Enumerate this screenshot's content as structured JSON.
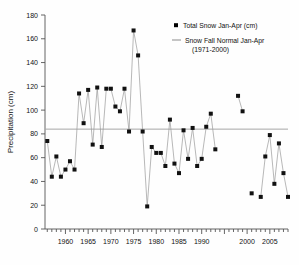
{
  "chart_data": {
    "type": "line",
    "title": "",
    "xlabel": "",
    "ylabel": "Precipitation (cm)",
    "xlim": [
      1955.5,
      2009
    ],
    "ylim": [
      0,
      180
    ],
    "ytick_labels": [
      "0",
      "20",
      "40",
      "60",
      "80",
      "100",
      "120",
      "140",
      "160",
      "180"
    ],
    "yticks": [
      0,
      20,
      40,
      60,
      80,
      100,
      120,
      140,
      160,
      180
    ],
    "xtick_labels": [
      "1960",
      "1965",
      "1970",
      "1975",
      "1980",
      "1985",
      "1990",
      "2000",
      "2005"
    ],
    "xticks": [
      1960,
      1965,
      1970,
      1975,
      1980,
      1985,
      1990,
      2000,
      2005
    ],
    "grid": false,
    "legend_position": "top-right",
    "legend": [
      {
        "name": "Total Snow Jan-Apr (cm)",
        "marker": "square",
        "color": "#000000"
      },
      {
        "name": "Snow Fall Normal Jan-Apr",
        "marker": "line",
        "color": "#999999"
      },
      {
        "name": "(1971-2000)",
        "marker": "none",
        "color": "#000000"
      }
    ],
    "reference_line": {
      "label": "Snow Fall Normal Jan-Apr (1971-2000)",
      "value": 84,
      "color": "#a6a6a6"
    },
    "series": [
      {
        "name": "Total Snow Jan-Apr (cm)",
        "color": "#000000",
        "x": [
          1956,
          1957,
          1958,
          1959,
          1960,
          1961,
          1962,
          1963,
          1964,
          1965,
          1966,
          1967,
          1968,
          1969,
          1970,
          1971,
          1972,
          1973,
          1974,
          1975,
          1976,
          1977,
          1978,
          1979,
          1980,
          1981,
          1982,
          1983,
          1984,
          1985,
          1986,
          1987,
          1988,
          1989,
          1990,
          1991,
          1992,
          1993,
          2000,
          2002,
          2003,
          2004,
          2005,
          2006,
          2007
        ],
        "values": [
          74,
          44,
          61,
          44,
          50,
          57,
          50,
          114,
          89,
          117,
          71,
          119,
          69,
          118,
          118,
          103,
          99,
          118,
          82,
          167,
          146,
          82,
          19,
          69,
          64,
          64,
          53,
          92,
          55,
          47,
          83,
          59,
          85,
          53,
          59,
          86,
          97,
          67,
          112,
          99,
          30,
          27,
          61,
          79,
          38
        ]
      }
    ],
    "data_points": [
      {
        "year": 1956,
        "value": 74
      },
      {
        "year": 1957,
        "value": 44
      },
      {
        "year": 1958,
        "value": 61
      },
      {
        "year": 1959,
        "value": 44
      },
      {
        "year": 1960,
        "value": 50
      },
      {
        "year": 1961,
        "value": 57
      },
      {
        "year": 1962,
        "value": 50
      },
      {
        "year": 1963,
        "value": 114
      },
      {
        "year": 1964,
        "value": 89
      },
      {
        "year": 1965,
        "value": 117
      },
      {
        "year": 1966,
        "value": 71
      },
      {
        "year": 1967,
        "value": 119
      },
      {
        "year": 1968,
        "value": 69
      },
      {
        "year": 1969,
        "value": 118
      },
      {
        "year": 1970,
        "value": 118
      },
      {
        "year": 1971,
        "value": 103
      },
      {
        "year": 1972,
        "value": 99
      },
      {
        "year": 1973,
        "value": 118
      },
      {
        "year": 1974,
        "value": 82
      },
      {
        "year": 1975,
        "value": 167
      },
      {
        "year": 1976,
        "value": 146
      },
      {
        "year": 1977,
        "value": 82
      },
      {
        "year": 1978,
        "value": 19
      },
      {
        "year": 1979,
        "value": 69
      },
      {
        "year": 1980,
        "value": 64
      },
      {
        "year": 1981,
        "value": 64
      },
      {
        "year": 1982,
        "value": 53
      },
      {
        "year": 1983,
        "value": 92
      },
      {
        "year": 1984,
        "value": 55
      },
      {
        "year": 1985,
        "value": 47
      },
      {
        "year": 1986,
        "value": 83
      },
      {
        "year": 1987,
        "value": 59
      },
      {
        "year": 1988,
        "value": 85
      },
      {
        "year": 1989,
        "value": 53
      },
      {
        "year": 1990,
        "value": 59
      },
      {
        "year": 1991,
        "value": 86
      },
      {
        "year": 1992,
        "value": 97
      },
      {
        "year": 1993,
        "value": 67
      },
      {
        "year": 1998,
        "value": 112
      },
      {
        "year": 1999,
        "value": 99
      },
      {
        "year": 2001,
        "value": 30
      },
      {
        "year": 2003,
        "value": 27
      },
      {
        "year": 2004,
        "value": 61
      },
      {
        "year": 2005,
        "value": 79
      },
      {
        "year": 2006,
        "value": 38
      },
      {
        "year": 2007,
        "value": 72
      },
      {
        "year": 2008,
        "value": 47
      },
      {
        "year": 2009,
        "value": 27
      }
    ]
  }
}
